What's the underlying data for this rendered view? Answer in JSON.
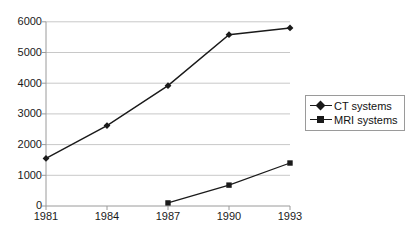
{
  "chart_data": {
    "type": "line",
    "title": "",
    "subtitle": "",
    "xlabel": "",
    "ylabel": "",
    "categories": [
      "1981",
      "1984",
      "1987",
      "1990",
      "1993"
    ],
    "x_tick_labels": [
      "1981",
      "1984",
      "1987",
      "1990",
      "1993"
    ],
    "y_tick_labels": [
      "0",
      "1000",
      "2000",
      "3000",
      "4000",
      "5000",
      "6000"
    ],
    "y_ticks": [
      0,
      1000,
      2000,
      3000,
      4000,
      5000,
      6000
    ],
    "ylim": [
      0,
      6000
    ],
    "grid": "horizontal",
    "legend_position": "right",
    "series": [
      {
        "name": "CT systems",
        "marker": "diamond",
        "color": "#1a1a1a",
        "values": [
          1550,
          2620,
          3920,
          5580,
          5800
        ]
      },
      {
        "name": "MRI systems",
        "marker": "square",
        "color": "#1a1a1a",
        "values": [
          null,
          null,
          100,
          680,
          1400
        ]
      }
    ],
    "legend": [
      {
        "label": "CT systems",
        "marker": "diamond-marker-icon"
      },
      {
        "label": "MRI systems",
        "marker": "square-marker-icon"
      }
    ]
  },
  "y_axis": {
    "t0": "0",
    "t1": "1000",
    "t2": "2000",
    "t3": "3000",
    "t4": "4000",
    "t5": "5000",
    "t6": "6000"
  },
  "x_axis": {
    "t0": "1981",
    "t1": "1984",
    "t2": "1987",
    "t3": "1990",
    "t4": "1993"
  },
  "legend": {
    "item0": "CT systems",
    "item1": "MRI systems"
  },
  "colors": {
    "series_line": "#1a1a1a",
    "gridline": "#c8c8c8",
    "axis": "#9a9a9a",
    "background": "#ffffff",
    "legend_border": "#9a9a9a"
  }
}
